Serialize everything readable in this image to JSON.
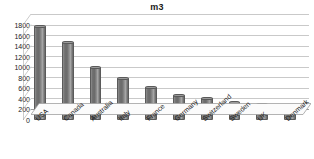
{
  "chart_data": {
    "type": "bar",
    "title": "m3",
    "xlabel": "",
    "ylabel": "",
    "categories": [
      "USA",
      "Canada",
      "Australia",
      "Italy",
      "France",
      "Germany",
      "Switzerland",
      "Sweden",
      "UK",
      "Denmark"
    ],
    "values": [
      1780,
      1480,
      1000,
      800,
      620,
      480,
      410,
      350,
      300,
      150
    ],
    "series": [
      {
        "name": "m3",
        "values": [
          1780,
          1480,
          1000,
          800,
          620,
          480,
          410,
          350,
          300,
          150
        ]
      }
    ],
    "ylim": [
      0,
      1800
    ],
    "ytick_labels": [
      "1800",
      "1600",
      "1400",
      "1200",
      "1000",
      "800",
      "600",
      "400",
      "200",
      "0"
    ],
    "ytick_values": [
      1800,
      1600,
      1400,
      1200,
      1000,
      800,
      600,
      400,
      200,
      0
    ],
    "ytick_step": 200,
    "grid": true,
    "legend": false,
    "legend_position": "none",
    "style": "3d-column",
    "colors": {
      "bar_fill": "#6f6f6f",
      "bar_highlight": "#a8a8a8",
      "bar_edge": "#5a5a5a",
      "gridline": "#c9c9c9",
      "axis": "#9a9a9a",
      "text": "#1a1a1a",
      "background": "#ffffff"
    }
  }
}
